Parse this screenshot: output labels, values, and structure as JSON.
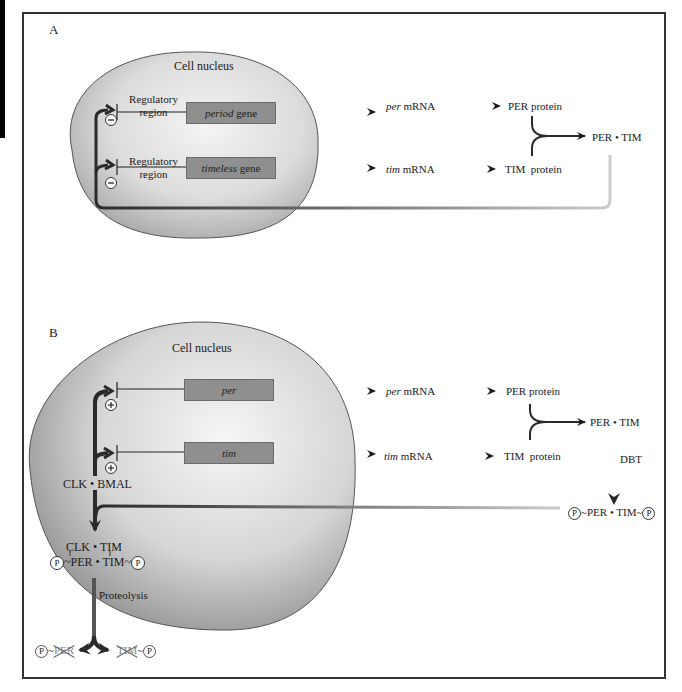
{
  "panel_a": {
    "letter": "A",
    "nucleus_label": "Cell nucleus",
    "genes": [
      {
        "regulatory_line1": "Regulatory",
        "regulatory_line2": "region",
        "gene_italic": "period",
        "gene_suffix": " gene",
        "sign": "−"
      },
      {
        "regulatory_line1": "Regulatory",
        "regulatory_line2": "region",
        "gene_italic": "timeless",
        "gene_suffix": " gene",
        "sign": "−"
      }
    ],
    "mrna": [
      {
        "italic": "per",
        "suffix": " mRNA"
      },
      {
        "italic": "tim",
        "suffix": " mRNA"
      }
    ],
    "proteins": [
      "PER protein",
      "TIM  protein"
    ],
    "complex": "PER • TIM"
  },
  "panel_b": {
    "letter": "B",
    "nucleus_label": "Cell nucleus",
    "genes": [
      {
        "gene_italic": "per",
        "sign": "+"
      },
      {
        "gene_italic": "tim",
        "sign": "+"
      }
    ],
    "activator": "CLK • BMAL",
    "mrna": [
      {
        "italic": "per",
        "suffix": " mRNA"
      },
      {
        "italic": "tim",
        "suffix": " mRNA"
      }
    ],
    "proteins": [
      "PER protein",
      "TIM  protein"
    ],
    "complex": "PER • TIM",
    "kinase": "DBT",
    "phospho_complex": {
      "p_left": "P",
      "text": "PER • TIM",
      "p_right": "P"
    },
    "nuclear_complex": {
      "top": "CLK • TIM",
      "p_left": "P",
      "bottom": "PER • TIM",
      "p_right": "P"
    },
    "proteolysis": "Proteolysis",
    "degraded": [
      {
        "p": "P",
        "text": "PER"
      },
      {
        "p": "P",
        "text": "TIM"
      }
    ]
  },
  "colors": {
    "frame": "#333333",
    "gene_box": "#8f8f8f",
    "nucleus_light": "#f2f2f2",
    "nucleus_dark": "#9a9a9a",
    "arrow": "#2a2a2a"
  }
}
